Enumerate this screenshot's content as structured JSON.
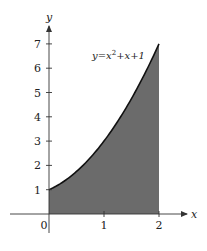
{
  "chart_data": {
    "type": "area",
    "title": "",
    "xlabel": "x",
    "ylabel": "y",
    "function": "y = x^2 + x + 1",
    "annotation": "y=x²+x+1",
    "x": [
      0,
      0.25,
      0.5,
      0.75,
      1,
      1.25,
      1.5,
      1.75,
      2
    ],
    "values": [
      1,
      1.3125,
      1.75,
      2.3125,
      3,
      3.8125,
      4.75,
      5.8125,
      7
    ],
    "shaded_region": {
      "x_from": 0,
      "x_to": 2,
      "below_curve": true
    },
    "x_ticks": [
      0,
      1,
      2
    ],
    "y_ticks": [
      1,
      2,
      3,
      4,
      5,
      6,
      7
    ],
    "xlim": [
      -0.75,
      2.4
    ],
    "ylim": [
      -0.5,
      7.8
    ],
    "grid": false,
    "colors": {
      "fill": "#6b6b6b",
      "curve": "#111111",
      "axis": "#333333"
    }
  }
}
